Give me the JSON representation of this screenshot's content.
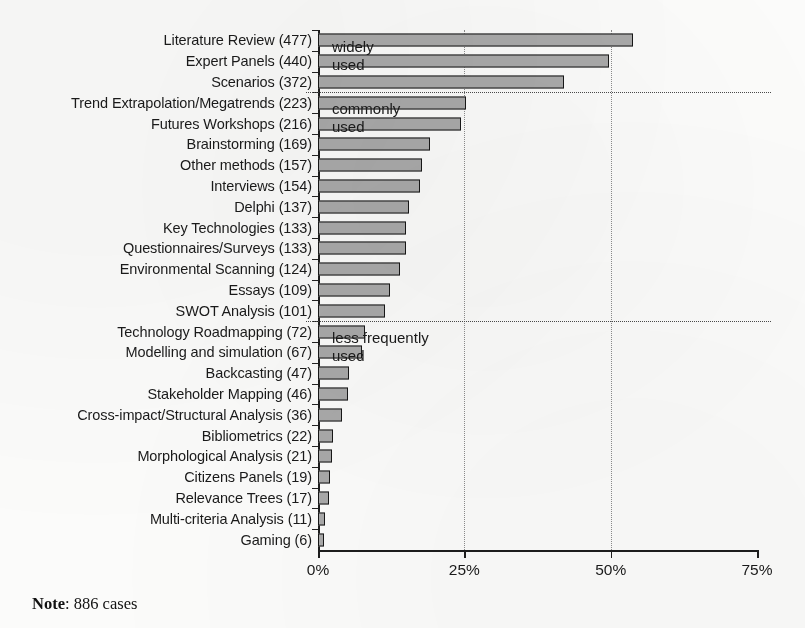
{
  "chart_data": {
    "type": "bar",
    "orientation": "horizontal",
    "title": "",
    "xlabel": "",
    "ylabel": "",
    "xlim": [
      0,
      75
    ],
    "xticks": [
      "0%",
      "25%",
      "50%",
      "75%"
    ],
    "xtick_values": [
      0,
      25,
      50,
      75
    ],
    "grid": "vertical dotted at 25% and 50%",
    "legend": "none",
    "total_cases": 886,
    "value_unit": "count (bar length = count / 886 as percent)",
    "categories": [
      "Literature Review (477)",
      "Expert Panels (440)",
      "Scenarios (372)",
      "Trend Extrapolation/Megatrends (223)",
      "Futures Workshops (216)",
      "Brainstorming (169)",
      "Other methods (157)",
      "Interviews (154)",
      "Delphi (137)",
      "Key Technologies (133)",
      "Questionnaires/Surveys (133)",
      "Environmental Scanning (124)",
      "Essays (109)",
      "SWOT Analysis (101)",
      "Technology Roadmapping (72)",
      "Modelling and simulation (67)",
      "Backcasting (47)",
      "Stakeholder Mapping (46)",
      "Cross-impact/Structural Analysis (36)",
      "Bibliometrics (22)",
      "Morphological Analysis (21)",
      "Citizens Panels (19)",
      "Relevance Trees (17)",
      "Multi-criteria Analysis (11)",
      "Gaming (6)"
    ],
    "counts": [
      477,
      440,
      372,
      223,
      216,
      169,
      157,
      154,
      137,
      133,
      133,
      124,
      109,
      101,
      72,
      67,
      47,
      46,
      36,
      22,
      21,
      19,
      17,
      11,
      6
    ],
    "values": [
      53.8,
      49.7,
      42.0,
      25.2,
      24.4,
      19.1,
      17.7,
      17.4,
      15.5,
      15.0,
      15.0,
      14.0,
      12.3,
      11.4,
      8.1,
      7.6,
      5.3,
      5.2,
      4.1,
      2.5,
      2.4,
      2.1,
      1.9,
      1.2,
      0.7
    ],
    "annotations": [
      {
        "label": "widely\nused",
        "after_index": 2
      },
      {
        "label": "commonly\nused",
        "after_index": 13
      },
      {
        "label": "less frequently\nused",
        "after_index": 24
      }
    ]
  },
  "footer": {
    "note_prefix": "Note",
    "note_text": ": 886 cases"
  },
  "colors": {
    "bar_fill": "#a9a9a9",
    "bar_border": "#171717",
    "axis": "#1d1d1d",
    "grid": "#8c8c8c",
    "text": "#1a1a1a",
    "background": "#fbfbfa"
  }
}
